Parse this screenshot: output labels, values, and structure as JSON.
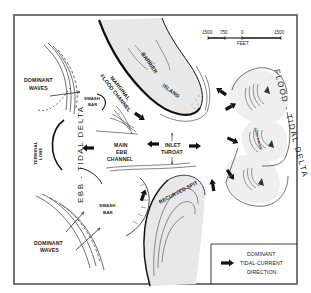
{
  "diagram": {
    "colors": {
      "frame": "#555555",
      "ink": "#111111",
      "land_fill": "#e6e6e6",
      "background": "#ffffff"
    },
    "scale_bar": {
      "ticks": [
        "1500",
        "750",
        "0",
        "1500"
      ],
      "unit": "FEET"
    },
    "labels": {
      "barrier_island_1": "BARRIER",
      "barrier_island_2": "ISLAND",
      "marginal_flood_channel_1": "MARGINAL",
      "marginal_flood_channel_2": "FLOOD CHANNEL",
      "swash_bar_top_1": "SWASH",
      "swash_bar_top_2": "BAR",
      "dominant_waves_top_1": "DOMINANT",
      "dominant_waves_top_2": "WAVES",
      "terminal_lobe_1": "TERMINAL",
      "terminal_lobe_2": "LOBE",
      "ebb_tidal_delta": "EBB - TIDAL DELTA",
      "main_ebb_channel_1": "MAIN",
      "main_ebb_channel_2": "EBB",
      "main_ebb_channel_3": "CHANNEL",
      "inlet_throat_1": "INLET",
      "inlet_throat_2": "THROAT",
      "flood_tidal_delta": "FLOOD - TIDAL DELTA",
      "sand_waves": "SAND WAVES",
      "recurved_spit": "RECURVED SPIT",
      "swash_bar_bottom_1": "SWASH",
      "swash_bar_bottom_2": "BAR",
      "dominant_waves_bottom_1": "DOMINANT",
      "dominant_waves_bottom_2": "WAVES"
    },
    "legend": {
      "line1": "DOMINANT",
      "line2": "TIDAL-CURRENT",
      "line3": "DIRECTION",
      "symbol": "arrow-right-bold"
    }
  }
}
